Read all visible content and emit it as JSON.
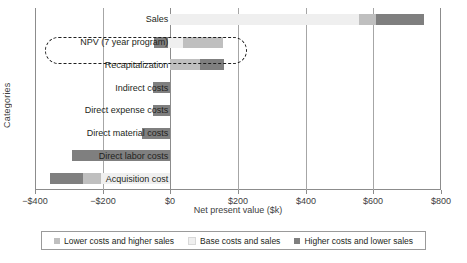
{
  "chart_data": {
    "type": "bar",
    "title": "",
    "subtitle": "",
    "xlabel": "Net present value ($k)",
    "ylabel": "Categories",
    "xlim": [
      -400,
      800
    ],
    "ylim": null,
    "grid": true,
    "orientation": "horizontal",
    "legend_position": "bottom",
    "xticks": [
      -400,
      -200,
      0,
      200,
      400,
      600,
      800
    ],
    "xticklabels": [
      "−$400",
      "−$200",
      "$0",
      "$200",
      "$400",
      "$600",
      "$800"
    ],
    "categories": [
      "Sales",
      "NPV (7 year program)",
      "Recapitalization",
      "Indirect costs",
      "Direct expense costs",
      "Direct material costs",
      "Direct labor costs",
      "Acquisition cost"
    ],
    "legend": [
      {
        "name": "Lower costs and higher sales",
        "color": "#bfbfbf"
      },
      {
        "name": "Base costs and sales",
        "color": "#efefef"
      },
      {
        "name": "Higher costs and lower sales",
        "color": "#7f7f7f"
      }
    ],
    "series": [
      {
        "name": "Lower costs and higher sales",
        "color": "#bfbfbf",
        "values": [
          0,
          -45,
          -105,
          -45,
          -45,
          -75,
          -290,
          -335
        ]
      },
      {
        "name": "Base costs and sales",
        "color": "#efefef",
        "values": [
          0,
          0,
          0,
          0,
          0,
          0,
          0,
          0
        ]
      },
      {
        "name": "Higher costs and lower sales",
        "color": "#7f7f7f",
        "values": [
          690,
          160,
          160,
          0,
          0,
          0,
          0,
          0
        ]
      }
    ],
    "bars": [
      {
        "category": "Sales",
        "segments": [
          {
            "series": "Base costs and sales",
            "start": 0,
            "end": 558,
            "color": "#efefef"
          },
          {
            "series": "Lower costs and higher sales",
            "start": 558,
            "end": 608,
            "color": "#bfbfbf"
          },
          {
            "series": "Higher costs and lower sales",
            "start": 608,
            "end": 749,
            "color": "#7f7f7f"
          }
        ],
        "start": 0,
        "end": 749
      },
      {
        "category": "NPV (7 year program)",
        "segments": [
          {
            "series": "Higher costs and lower sales",
            "start": -47,
            "end": -8,
            "color": "#7f7f7f"
          },
          {
            "series": "Base costs and sales",
            "start": -8,
            "end": 36,
            "color": "#efefef"
          },
          {
            "series": "Lower costs and higher sales",
            "start": 36,
            "end": 157,
            "color": "#bfbfbf"
          }
        ],
        "start": -47,
        "end": 157
      },
      {
        "category": "Recapitalization",
        "segments": [
          {
            "series": "Lower costs and higher sales",
            "start": 0,
            "end": 89,
            "color": "#bfbfbf"
          },
          {
            "series": "Higher costs and lower sales",
            "start": 89,
            "end": 160,
            "color": "#7f7f7f"
          }
        ],
        "start": 0,
        "end": 160
      },
      {
        "category": "Indirect costs",
        "segments": [
          {
            "series": "Higher costs and lower sales",
            "start": -50,
            "end": 0,
            "color": "#7f7f7f"
          }
        ],
        "start": -50,
        "end": 0
      },
      {
        "category": "Direct expense costs",
        "segments": [
          {
            "series": "Higher costs and lower sales",
            "start": -50,
            "end": 0,
            "color": "#7f7f7f"
          }
        ],
        "start": -50,
        "end": 0
      },
      {
        "category": "Direct material costs",
        "segments": [
          {
            "series": "Higher costs and lower sales",
            "start": -83,
            "end": 0,
            "color": "#7f7f7f"
          }
        ],
        "start": -83,
        "end": 0
      },
      {
        "category": "Direct labor costs",
        "segments": [
          {
            "series": "Higher costs and lower sales",
            "start": -290,
            "end": 0,
            "color": "#7f7f7f"
          }
        ],
        "start": -290,
        "end": 0
      },
      {
        "category": "Acquisition cost",
        "segments": [
          {
            "series": "Higher costs and lower sales",
            "start": -357,
            "end": -257,
            "color": "#7f7f7f"
          },
          {
            "series": "Lower costs and higher sales",
            "start": -257,
            "end": -205,
            "color": "#bfbfbf"
          },
          {
            "series": "Base costs and sales",
            "start": -205,
            "end": 0,
            "color": "#efefef"
          }
        ],
        "start": -357,
        "end": 0
      }
    ],
    "annotations": [
      {
        "type": "dashed-rounded-rect",
        "target": "NPV (7 year program)",
        "label": ""
      }
    ]
  }
}
